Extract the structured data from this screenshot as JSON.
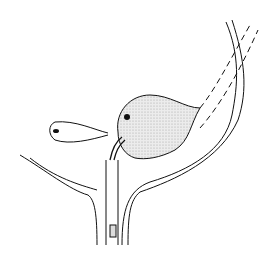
{
  "figure": {
    "type": "anatomical line drawing",
    "labels": [],
    "colors": {
      "line": "#111111",
      "fill_stipple": "#d9d9d9",
      "background": "#ffffff"
    }
  }
}
